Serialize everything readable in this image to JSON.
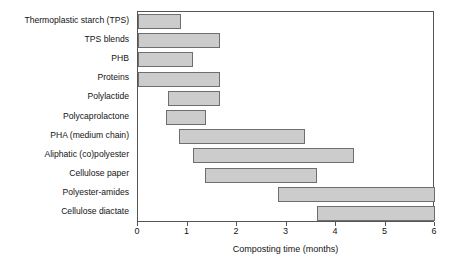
{
  "chart_data": {
    "type": "bar",
    "orientation": "horizontal",
    "title": "",
    "xlabel": "Composting time (months)",
    "ylabel": "",
    "xlim": [
      0,
      6
    ],
    "xticks": [
      0,
      1,
      2,
      3,
      4,
      5,
      6
    ],
    "xtick_labels": [
      "0",
      "1",
      "2",
      "3",
      "4",
      "5",
      "6"
    ],
    "grid": false,
    "legend": null,
    "bar_style": {
      "fill": "#cccccc",
      "edge": "#6e6e6e"
    },
    "categories": [
      "Thermoplastic starch (TPS)",
      "TPS blends",
      "PHB",
      "Proteins",
      "Polylactide",
      "Polycaprolactone",
      "PHA (medium chain)",
      "Aliphatic (co)polyester",
      "Cellulose paper",
      "Polyester-amides",
      "Cellulose diactate"
    ],
    "ranges": [
      {
        "label": "Thermoplastic starch (TPS)",
        "start": 0.0,
        "end": 0.87
      },
      {
        "label": "TPS blends",
        "start": 0.0,
        "end": 1.65
      },
      {
        "label": "PHB",
        "start": 0.0,
        "end": 1.12
      },
      {
        "label": "Proteins",
        "start": 0.0,
        "end": 1.65
      },
      {
        "label": "Polylactide",
        "start": 0.6,
        "end": 1.65
      },
      {
        "label": "Polycaprolactone",
        "start": 0.57,
        "end": 1.37
      },
      {
        "label": "PHA (medium chain)",
        "start": 0.83,
        "end": 3.38
      },
      {
        "label": "Aliphatic (co)polyester",
        "start": 1.12,
        "end": 4.37
      },
      {
        "label": "Cellulose paper",
        "start": 1.35,
        "end": 3.62
      },
      {
        "label": "Polyester-amides",
        "start": 2.82,
        "end": 6.0
      },
      {
        "label": "Cellulose diactate",
        "start": 3.62,
        "end": 6.0
      }
    ]
  }
}
